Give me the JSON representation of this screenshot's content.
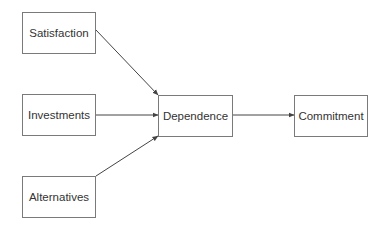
{
  "diagram": {
    "type": "flow",
    "colors": {
      "border": "#7a7a7a",
      "text": "#333333",
      "edge": "#444444",
      "background": "#ffffff"
    },
    "nodes": [
      {
        "id": "satisfaction",
        "label": "Satisfaction",
        "x": 22,
        "y": 12,
        "w": 74,
        "h": 42
      },
      {
        "id": "investments",
        "label": "Investments",
        "x": 22,
        "y": 94,
        "w": 74,
        "h": 42
      },
      {
        "id": "alternatives",
        "label": "Alternatives",
        "x": 22,
        "y": 176,
        "w": 74,
        "h": 42
      },
      {
        "id": "dependence",
        "label": "Dependence",
        "x": 158,
        "y": 95,
        "w": 75,
        "h": 42
      },
      {
        "id": "commitment",
        "label": "Commitment",
        "x": 294,
        "y": 95,
        "w": 74,
        "h": 42
      }
    ],
    "edges": [
      {
        "from": "satisfaction",
        "to": "dependence"
      },
      {
        "from": "investments",
        "to": "dependence"
      },
      {
        "from": "alternatives",
        "to": "dependence"
      },
      {
        "from": "dependence",
        "to": "commitment"
      }
    ]
  }
}
